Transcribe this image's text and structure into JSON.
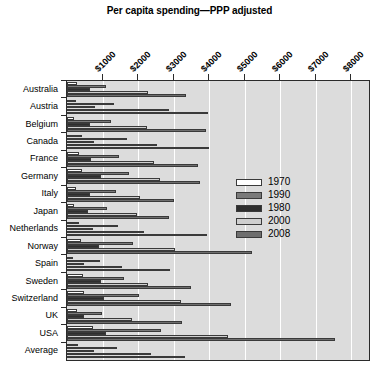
{
  "chart_data": {
    "type": "bar",
    "orientation": "horizontal",
    "title": "Per capita spending—PPP adjusted",
    "xlabel": "",
    "ylabel": "",
    "xlim": [
      0,
      8500
    ],
    "xticks": [
      1000,
      2000,
      3000,
      4000,
      5000,
      6000,
      7000,
      8000
    ],
    "xticklabels": [
      "$1000",
      "$2000",
      "$3000",
      "$4000",
      "$5000",
      "$6000",
      "$7000",
      "$8000"
    ],
    "grid": true,
    "legend_position": "center-right",
    "legend_entries": [
      "1970",
      "1990",
      "1980",
      "2000",
      "2008"
    ],
    "categories": [
      "Australia",
      "Austria",
      "Belgium",
      "Canada",
      "France",
      "Germany",
      "Italy",
      "Japan",
      "Netherlands",
      "Norway",
      "Spain",
      "Sweden",
      "Switzerland",
      "UK",
      "USA",
      "Average"
    ],
    "series": [
      {
        "name": "1970",
        "color": "#ffffff",
        "values": [
          280,
          250,
          210,
          420,
          350,
          410,
          260,
          190,
          340,
          380,
          180,
          460,
          470,
          290,
          720,
          300
        ]
      },
      {
        "name": "1990",
        "color": "#7a7a7a",
        "values": [
          1100,
          1320,
          1250,
          1700,
          1450,
          1750,
          1370,
          1120,
          1430,
          1870,
          930,
          1600,
          2040,
          980,
          2640,
          1410
        ]
      },
      {
        "name": "1980",
        "color": "#2e2e2e",
        "values": [
          660,
          780,
          660,
          760,
          680,
          960,
          660,
          580,
          740,
          890,
          470,
          960,
          1040,
          470,
          1100,
          750
        ]
      },
      {
        "name": "2000",
        "color": "#cfcfcf",
        "values": [
          2270,
          2860,
          2240,
          2520,
          2450,
          2630,
          2050,
          1970,
          2170,
          3040,
          1540,
          2290,
          3220,
          1830,
          4540,
          2370
        ]
      },
      {
        "name": "2008",
        "color": "#6e6e6e",
        "values": [
          3350,
          3970,
          3900,
          4010,
          3700,
          3740,
          3000,
          2880,
          3930,
          5200,
          2900,
          3480,
          4620,
          3230,
          7540,
          3330
        ]
      }
    ]
  }
}
